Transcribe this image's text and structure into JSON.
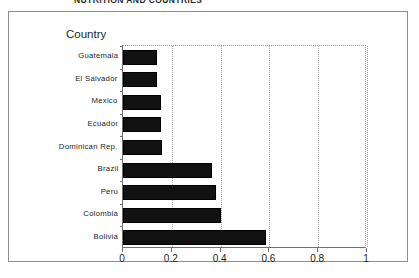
{
  "caption": {
    "text": "NUTRITION AND COUNTRIES"
  },
  "chart_data": {
    "type": "bar",
    "orientation": "horizontal",
    "title": "",
    "xlabel": "",
    "ylabel": "Country",
    "categories": [
      "Guatemala",
      "El Salvador",
      "Mexico",
      "Ecuador",
      "Dominican Rep.",
      "Brazil",
      "Peru",
      "Colombia",
      "Bolivia"
    ],
    "values": [
      0.14,
      0.14,
      0.155,
      0.155,
      0.16,
      0.365,
      0.38,
      0.4,
      0.585
    ],
    "xlim": [
      0,
      1
    ],
    "xticks": [
      0,
      0.2,
      0.4,
      0.6,
      0.8,
      1
    ],
    "xticklabels": [
      "0",
      "0.2",
      "0.4",
      "0.6",
      "0.8",
      "1"
    ],
    "grid": "vertical-dotted",
    "legend": "none",
    "bar_color": "#111111"
  }
}
